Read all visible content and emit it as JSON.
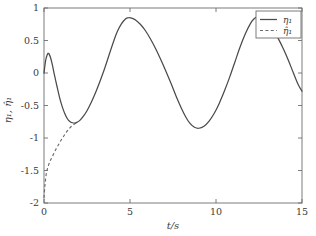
{
  "chart_data": {
    "type": "line",
    "title": "",
    "xlabel": "t/s",
    "ylabel": "η₁, η̂₁",
    "xlim": [
      0,
      15
    ],
    "ylim": [
      -2,
      1
    ],
    "xticks": [
      "0",
      "5",
      "10",
      "15"
    ],
    "xtick_values": [
      0,
      5,
      10,
      15
    ],
    "yticks": [
      "1",
      "0.5",
      "0",
      "-0.5",
      "-1",
      "-1.5",
      "-2"
    ],
    "ytick_values": [
      1,
      0.5,
      0,
      -0.5,
      -1,
      -1.5,
      -2
    ],
    "grid": false,
    "legend_position": "upper right",
    "series": [
      {
        "name": "η₁",
        "style": "solid",
        "color": "#4a4a4a",
        "x": [
          0.0,
          0.1,
          0.2,
          0.25,
          0.3,
          0.4,
          0.5,
          0.6,
          0.75,
          0.9,
          1.05,
          1.2,
          1.35,
          1.5,
          1.65,
          1.8,
          1.95,
          2.1,
          2.3,
          2.5,
          2.75,
          3.0,
          3.25,
          3.5,
          3.75,
          4.0,
          4.25,
          4.5,
          4.75,
          4.9,
          5.1,
          5.3,
          5.6,
          5.9,
          6.2,
          6.5,
          6.8,
          7.1,
          7.4,
          7.7,
          8.0,
          8.25,
          8.5,
          8.75,
          9.0,
          9.3,
          9.6,
          9.9,
          10.2,
          10.5,
          10.8,
          11.1,
          11.4,
          11.7,
          12.0,
          12.2,
          12.4,
          12.6,
          12.8,
          13.0,
          13.3,
          13.6,
          13.9,
          14.2,
          14.5,
          14.8,
          15.0
        ],
        "y": [
          0.0,
          0.2,
          0.29,
          0.3,
          0.29,
          0.22,
          0.11,
          -0.02,
          -0.2,
          -0.37,
          -0.51,
          -0.62,
          -0.7,
          -0.745,
          -0.765,
          -0.77,
          -0.755,
          -0.725,
          -0.66,
          -0.58,
          -0.45,
          -0.3,
          -0.13,
          0.05,
          0.25,
          0.45,
          0.63,
          0.755,
          0.835,
          0.85,
          0.845,
          0.82,
          0.75,
          0.65,
          0.52,
          0.37,
          0.2,
          0.02,
          -0.17,
          -0.37,
          -0.55,
          -0.68,
          -0.78,
          -0.835,
          -0.85,
          -0.82,
          -0.74,
          -0.62,
          -0.46,
          -0.27,
          -0.06,
          0.17,
          0.4,
          0.6,
          0.76,
          0.83,
          0.868,
          0.865,
          0.84,
          0.79,
          0.68,
          0.54,
          0.38,
          0.2,
          0.0,
          -0.19,
          -0.28
        ]
      },
      {
        "name": "η̂₁",
        "style": "dashed",
        "color": "#6a6a6a",
        "x": [
          0.0,
          0.05,
          0.1,
          0.15,
          0.2,
          0.3,
          0.4,
          0.55,
          0.7,
          0.85,
          1.0,
          1.15,
          1.3,
          1.45,
          1.6,
          1.75,
          1.9
        ],
        "y": [
          -1.92,
          -1.74,
          -1.61,
          -1.52,
          -1.47,
          -1.39,
          -1.33,
          -1.25,
          -1.17,
          -1.1,
          -1.03,
          -0.97,
          -0.91,
          -0.86,
          -0.82,
          -0.79,
          -0.77
        ]
      }
    ],
    "annotations": []
  },
  "legend": {
    "entries": [
      {
        "label": "η₁",
        "style": "solid"
      },
      {
        "label": "η̂₁",
        "style": "dashed"
      }
    ]
  }
}
